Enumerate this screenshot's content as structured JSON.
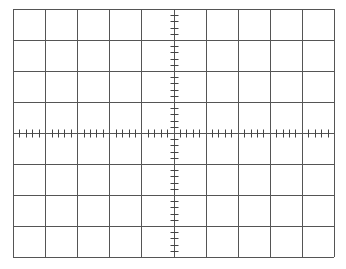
{
  "graticule": {
    "columns": 10,
    "rows": 8,
    "minor_divisions_per_major": 5,
    "left": 13,
    "top": 9,
    "width": 321,
    "height": 248,
    "grid_color": "#555555",
    "tick_color": "#444444",
    "background": "#ffffff"
  }
}
